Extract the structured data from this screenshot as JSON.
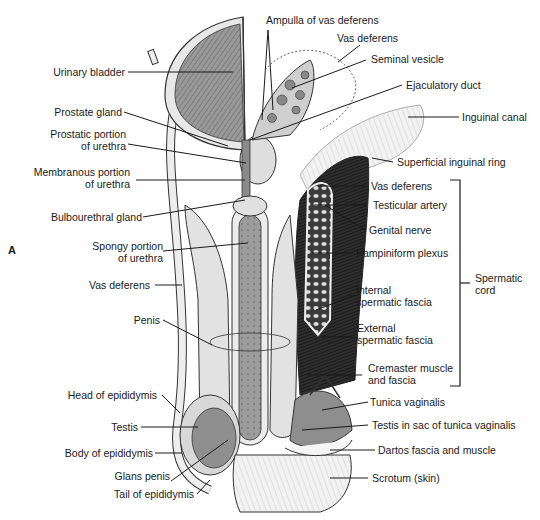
{
  "figure": {
    "panel_letter": "A",
    "signature": "artist signature (illegible)"
  },
  "labels_left": [
    {
      "id": "urinary-bladder",
      "text": [
        "Urinary bladder"
      ]
    },
    {
      "id": "prostate-gland",
      "text": [
        "Prostate gland"
      ]
    },
    {
      "id": "prostatic-urethra",
      "text": [
        "Prostatic portion",
        "of urethra"
      ]
    },
    {
      "id": "membranous-urethra",
      "text": [
        "Membranous portion",
        "of urethra"
      ]
    },
    {
      "id": "bulbourethral-gland",
      "text": [
        "Bulbourethral gland"
      ]
    },
    {
      "id": "spongy-urethra",
      "text": [
        "Spongy portion",
        "of urethra"
      ]
    },
    {
      "id": "vas-deferens-left",
      "text": [
        "Vas deferens"
      ]
    },
    {
      "id": "penis",
      "text": [
        "Penis"
      ]
    },
    {
      "id": "head-epididymis",
      "text": [
        "Head of epididymis"
      ]
    },
    {
      "id": "testis",
      "text": [
        "Testis"
      ]
    },
    {
      "id": "body-epididymis",
      "text": [
        "Body of epididymis"
      ]
    },
    {
      "id": "glans-penis",
      "text": [
        "Glans penis"
      ]
    },
    {
      "id": "tail-epididymis",
      "text": [
        "Tail of epididymis"
      ]
    }
  ],
  "labels_top": [
    {
      "id": "ampulla",
      "text": [
        "Ampulla of vas deferens"
      ]
    },
    {
      "id": "vas-deferens-top",
      "text": [
        "Vas deferens"
      ]
    },
    {
      "id": "seminal-vesicle",
      "text": [
        "Seminal vesicle"
      ]
    },
    {
      "id": "ejaculatory-duct",
      "text": [
        "Ejaculatory duct"
      ]
    },
    {
      "id": "inguinal-canal",
      "text": [
        "Inguinal canal"
      ]
    },
    {
      "id": "superficial-inguinal-ring",
      "text": [
        "Superficial inguinal ring"
      ]
    }
  ],
  "labels_right": [
    {
      "id": "vas-deferens-cord",
      "text": [
        "Vas deferens"
      ]
    },
    {
      "id": "testicular-artery",
      "text": [
        "Testicular artery"
      ]
    },
    {
      "id": "genital-nerve",
      "text": [
        "Genital nerve"
      ]
    },
    {
      "id": "pampiniform-plexus",
      "text": [
        "Pampiniform plexus"
      ]
    },
    {
      "id": "internal-spermatic-fascia",
      "text": [
        "Internal",
        "spermatic fascia"
      ]
    },
    {
      "id": "external-spermatic-fascia",
      "text": [
        "External",
        "spermatic fascia"
      ]
    },
    {
      "id": "cremaster",
      "text": [
        "Cremaster muscle",
        "and fascia"
      ]
    },
    {
      "id": "tunica-vaginalis",
      "text": [
        "Tunica vaginalis"
      ]
    },
    {
      "id": "testis-in-sac",
      "text": [
        "Testis in sac of tunica vaginalis"
      ]
    },
    {
      "id": "dartos",
      "text": [
        "Dartos fascia and muscle"
      ]
    },
    {
      "id": "scrotum",
      "text": [
        "Scrotum (skin)"
      ]
    }
  ],
  "bracket": {
    "label": [
      "Spermatic",
      "cord"
    ]
  },
  "colors": {
    "line": "#1a1a1a",
    "tissue_light": "#e6e6e6",
    "tissue_mid": "#a8a8a8",
    "tissue_dark": "#6e6e6e",
    "muscle_dark": "#2b2b2b",
    "outline": "#333333"
  }
}
